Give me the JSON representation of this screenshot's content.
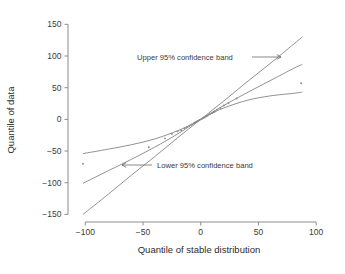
{
  "chart_data": {
    "type": "line",
    "title": "",
    "xlabel": "Quantile of stable distribution",
    "ylabel": "Quantile of data",
    "xlim": [
      -115,
      112
    ],
    "ylim": [
      -162,
      160
    ],
    "xticks": [
      -100,
      -50,
      0,
      50,
      100
    ],
    "xticklabels": [
      "−100",
      "−50",
      "0",
      "50",
      "100"
    ],
    "yticks": [
      -150,
      -100,
      -50,
      0,
      50,
      100,
      150
    ],
    "yticklabels": [
      "−150",
      "−100",
      "−50",
      "0",
      "50",
      "100",
      "150"
    ],
    "grid": false,
    "legend": "none",
    "line_color": "#7d7d7d",
    "point_color": "#8a8a8a",
    "axis_color": "#808080",
    "series": [
      {
        "name": "reference line",
        "comment": "steep central straight line through origin",
        "x": [
          -102,
          -80,
          -60,
          -40,
          -20,
          0,
          20,
          40,
          60,
          80,
          88
        ],
        "values": [
          -150,
          -118,
          -88,
          -59,
          -29,
          0,
          29,
          59,
          88,
          118,
          130
        ]
      },
      {
        "name": "Upper 95% confidence band",
        "comment": "upper band: steeper than data tail at right, above reference at left",
        "x": [
          -102,
          -80,
          -60,
          -40,
          -20,
          -8,
          0,
          8,
          20,
          40,
          60,
          80,
          88
        ],
        "values": [
          -101,
          -81,
          -63,
          -44,
          -23,
          -9,
          0,
          9,
          22,
          42,
          61,
          80,
          87
        ]
      },
      {
        "name": "Lower 95% confidence band",
        "comment": "lower band: shallow flattening curve",
        "x": [
          -102,
          -80,
          -60,
          -40,
          -20,
          -8,
          0,
          8,
          20,
          40,
          60,
          80,
          88
        ],
        "values": [
          -54,
          -47,
          -40,
          -31,
          -18,
          -8,
          0,
          8,
          18,
          30,
          37,
          41,
          43
        ]
      }
    ],
    "points": {
      "name": "sample quantiles",
      "x": [
        -102,
        -45,
        -31,
        -25,
        -20,
        -17,
        -14,
        -12,
        -10,
        -8,
        -6,
        -5,
        -4,
        -3,
        -2,
        -1,
        0,
        1,
        2,
        3,
        4,
        5,
        6,
        8,
        10,
        12,
        14,
        17,
        20,
        24,
        31,
        87
      ],
      "values": [
        -70,
        -44,
        -30,
        -23,
        -19,
        -17,
        -14,
        -12,
        -10,
        -8,
        -6,
        -5,
        -4,
        -3,
        -2,
        -1,
        0,
        1,
        2,
        3,
        4,
        5,
        6,
        8,
        10,
        12,
        15,
        18,
        22,
        26,
        33,
        57
      ]
    },
    "annotations": [
      {
        "name": "upper-band-annotation",
        "text": "Upper 95% confidence band",
        "text_x": 137,
        "text_y": 60,
        "arrow": "right",
        "arrow_from_x": 252,
        "arrow_from_y": 57,
        "arrow_to_x": 281,
        "arrow_to_y": 57
      },
      {
        "name": "lower-band-annotation",
        "text": "Lower 95% confidence band",
        "text_x": 157,
        "text_y": 168,
        "arrow": "left",
        "arrow_from_x": 152,
        "arrow_from_y": 165,
        "arrow_to_x": 122,
        "arrow_to_y": 165
      }
    ]
  }
}
